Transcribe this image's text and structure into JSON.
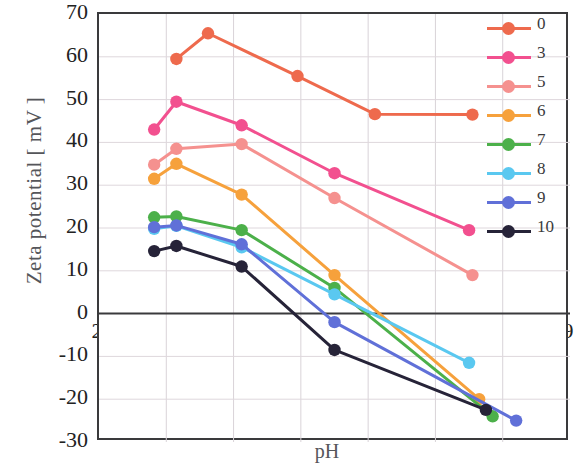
{
  "chart_data": {
    "type": "line",
    "title": "",
    "xlabel": "pH",
    "ylabel": "Zeta potential [ mV ]",
    "xlim": [
      2,
      9
    ],
    "ylim": [
      -30,
      70
    ],
    "xticks": [
      2,
      3,
      4,
      5,
      6,
      7,
      8,
      9
    ],
    "yticks": [
      70,
      60,
      50,
      40,
      30,
      20,
      10,
      0,
      -10,
      -20,
      -30
    ],
    "grid": true,
    "legend_position": "top-right",
    "legend_title": "",
    "series": [
      {
        "name": "0",
        "color": "#ee6a4d",
        "x": [
          3.15,
          3.62,
          4.95,
          6.1,
          7.55
        ],
        "y": [
          59.5,
          65.5,
          55.5,
          46.6,
          46.5
        ]
      },
      {
        "name": "3",
        "color": "#f2508f",
        "x": [
          2.82,
          3.15,
          4.12,
          5.5,
          7.5
        ],
        "y": [
          43.0,
          49.5,
          44.0,
          32.8,
          19.5
        ]
      },
      {
        "name": "5",
        "color": "#f5918f",
        "x": [
          2.82,
          3.15,
          4.12,
          5.5,
          7.55
        ],
        "y": [
          34.8,
          38.5,
          39.6,
          27.0,
          9.0
        ]
      },
      {
        "name": "6",
        "color": "#f6a13c",
        "x": [
          2.82,
          3.15,
          4.12,
          5.5,
          7.65
        ],
        "y": [
          31.5,
          35.0,
          27.8,
          9.0,
          -20.0
        ]
      },
      {
        "name": "7",
        "color": "#4cb04a",
        "x": [
          2.82,
          3.15,
          4.12,
          5.5,
          7.85
        ],
        "y": [
          22.5,
          22.7,
          19.5,
          6.0,
          -24.0
        ]
      },
      {
        "name": "8",
        "color": "#5ac8f0",
        "x": [
          2.82,
          3.15,
          4.12,
          5.5,
          7.5
        ],
        "y": [
          19.8,
          20.5,
          15.5,
          4.5,
          -11.5
        ]
      },
      {
        "name": "9",
        "color": "#6070d8",
        "x": [
          2.82,
          3.15,
          4.12,
          5.5,
          8.2
        ],
        "y": [
          20.2,
          20.6,
          16.2,
          -2.0,
          -25.0
        ]
      },
      {
        "name": "10",
        "color": "#262338",
        "x": [
          2.82,
          3.15,
          4.12,
          5.5,
          7.75
        ],
        "y": [
          14.6,
          15.8,
          11.0,
          -8.5,
          -22.5
        ]
      }
    ]
  }
}
